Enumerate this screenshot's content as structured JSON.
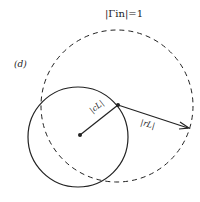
{
  "diagram": {
    "panel_label": "(d)",
    "title_label": "|Γin|=1",
    "center_label": "|cL|",
    "radius_label": "|rL|",
    "colors": {
      "stroke": "#222222",
      "background": "#ffffff"
    },
    "unit_circle": {
      "style": "dashed",
      "cx": 117,
      "cy": 106,
      "r": 76
    },
    "stability_circle": {
      "style": "solid",
      "cx": 78,
      "cy": 137,
      "r": 50
    },
    "center_vector": {
      "from": [
        78,
        137
      ],
      "to": [
        118,
        105
      ]
    },
    "radius_vector": {
      "from": [
        118,
        105
      ],
      "to": [
        189,
        128
      ]
    }
  }
}
